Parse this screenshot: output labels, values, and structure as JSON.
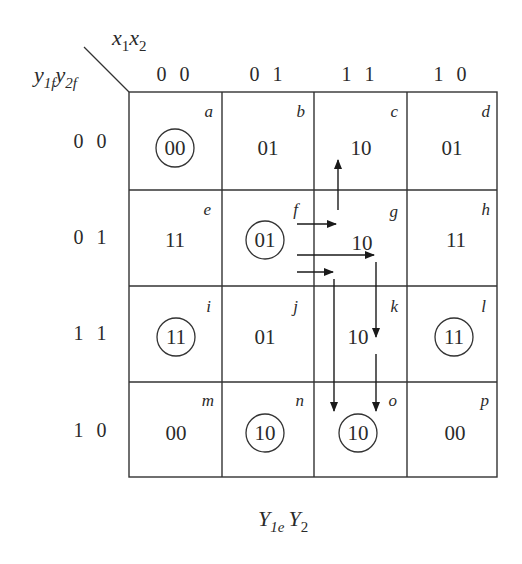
{
  "diagram": {
    "type": "karnaugh-map-transition-table",
    "column_variables": {
      "label": "x",
      "index1": "1",
      "label2": "x",
      "index2": "2"
    },
    "row_variables": {
      "label": "y",
      "index1": "1f",
      "label2": "y",
      "index2": "2f"
    },
    "output_variables": {
      "label": "Y",
      "index1": "1e",
      "label2": "Y",
      "index2": "2"
    },
    "column_headers": [
      "0 0",
      "0 1",
      "1 1",
      "1 0"
    ],
    "row_headers": [
      "0 0",
      "0 1",
      "1 1",
      "1 0"
    ],
    "cells": [
      [
        {
          "letter": "a",
          "value": "00",
          "stable": true
        },
        {
          "letter": "b",
          "value": "01",
          "stable": false
        },
        {
          "letter": "c",
          "value": "10",
          "stable": false
        },
        {
          "letter": "d",
          "value": "01",
          "stable": false
        }
      ],
      [
        {
          "letter": "e",
          "value": "11",
          "stable": false
        },
        {
          "letter": "f",
          "value": "01",
          "stable": true
        },
        {
          "letter": "g",
          "value": "10",
          "stable": false
        },
        {
          "letter": "h",
          "value": "11",
          "stable": false
        }
      ],
      [
        {
          "letter": "i",
          "value": "11",
          "stable": true
        },
        {
          "letter": "j",
          "value": "01",
          "stable": false
        },
        {
          "letter": "k",
          "value": "10",
          "stable": false
        },
        {
          "letter": "l",
          "value": "11",
          "stable": true
        }
      ],
      [
        {
          "letter": "m",
          "value": "00",
          "stable": false
        },
        {
          "letter": "n",
          "value": "10",
          "stable": true
        },
        {
          "letter": "o",
          "value": "10",
          "stable": true
        },
        {
          "letter": "p",
          "value": "00",
          "stable": false
        }
      ]
    ],
    "transitions": [
      {
        "from": "f",
        "to": "g",
        "then": "c",
        "description": "f → g → c"
      },
      {
        "from": "f",
        "to": "g",
        "then": "k → o",
        "description": "f → g → k → o"
      },
      {
        "from": "f",
        "to": "g",
        "then": "o",
        "description": "f → (g) → o"
      }
    ]
  }
}
